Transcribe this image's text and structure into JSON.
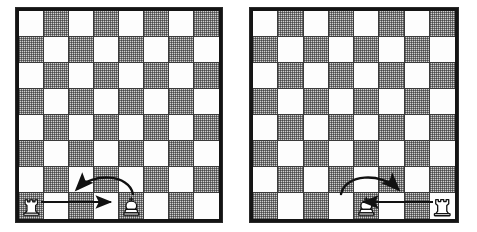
{
  "figure": {
    "background_color": "#ffffff",
    "board_border_color": "#141414",
    "light_square_color": "#fdfdfd",
    "dark_square_color": "#cfcfcf",
    "grid_line_color": "#3a3a3a",
    "piece_outline_color": "#111111",
    "piece_fill_color": "#ffffff",
    "arrow_color": "#111111"
  },
  "boards": [
    {
      "id": "left",
      "name": "queenside-castling-board",
      "label": "Queenside castling",
      "files": [
        "a",
        "b",
        "c",
        "d",
        "e",
        "f",
        "g",
        "h"
      ],
      "ranks": [
        8,
        7,
        6,
        5,
        4,
        3,
        2,
        1
      ],
      "top_left_square_color": "light",
      "pieces": [
        {
          "piece": "rook",
          "color": "white",
          "square": "a1",
          "file_index": 0,
          "rank_index": 7,
          "icon": "white-rook-icon"
        },
        {
          "piece": "king",
          "color": "white",
          "square": "e1",
          "file_index": 4,
          "rank_index": 7,
          "icon": "white-king-icon"
        }
      ],
      "arrows": [
        {
          "name": "rook-move-arrow",
          "type": "straight",
          "from": "a1",
          "to": "d1",
          "direction": "right",
          "description": "Rook slides from a1 toward d1"
        },
        {
          "name": "king-move-arrow",
          "type": "curved",
          "from": "e1",
          "to": "c1",
          "direction": "left",
          "description": "King leaps over from e1 to c1"
        }
      ],
      "artifacts": [
        {
          "name": "scan-speck",
          "x_pct": 46,
          "y_pct": 50
        }
      ]
    },
    {
      "id": "right",
      "name": "kingside-castling-board",
      "label": "Kingside castling",
      "files": [
        "a",
        "b",
        "c",
        "d",
        "e",
        "f",
        "g",
        "h"
      ],
      "ranks": [
        8,
        7,
        6,
        5,
        4,
        3,
        2,
        1
      ],
      "top_left_square_color": "light",
      "pieces": [
        {
          "piece": "king",
          "color": "white",
          "square": "e1",
          "file_index": 4,
          "rank_index": 7,
          "icon": "white-king-icon"
        },
        {
          "piece": "rook",
          "color": "white",
          "square": "h1",
          "file_index": 7,
          "rank_index": 7,
          "icon": "white-rook-icon"
        }
      ],
      "arrows": [
        {
          "name": "rook-move-arrow",
          "type": "straight",
          "from": "h1",
          "to": "f1",
          "direction": "left",
          "description": "Rook slides from h1 toward f1"
        },
        {
          "name": "king-move-arrow",
          "type": "curved",
          "from": "e1",
          "to": "g1",
          "direction": "right",
          "description": "King leaps over from e1 to g1"
        }
      ],
      "artifacts": []
    }
  ]
}
